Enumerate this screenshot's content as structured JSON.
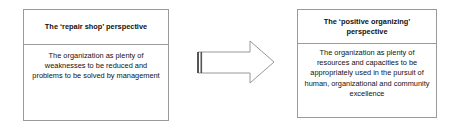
{
  "diagram": {
    "left_box": {
      "title": "The ‘repair shop’ perspective",
      "description": "The organization as plenty of weaknesses to be reduced and problems to be solved by management"
    },
    "arrow": {
      "icon": "right-arrow-icon",
      "direction": "right"
    },
    "right_box": {
      "title": "The ‘positive organizing’ perspective",
      "description": "The organization as plenty of resources and capacities to be appropriately used in the pursuit of human, organizational and community excellence"
    },
    "colors": {
      "border": "#9a9a9a",
      "arrow_stroke": "#8c8c8c",
      "arrow_tail": "#555555",
      "text": "#111111",
      "background": "#ffffff"
    }
  }
}
